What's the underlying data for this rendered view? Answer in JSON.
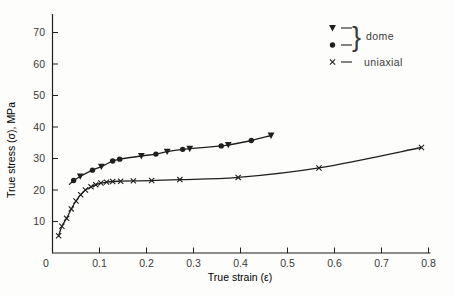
{
  "figure": {
    "background": "#fdfdfb",
    "ink": "#1f1f1f",
    "text_color": "#3a3a3a"
  },
  "chart_data": {
    "type": "line-scatter",
    "title": "",
    "xlabel": "True strain (ε)",
    "ylabel": "True stress (σ), MPa",
    "xlim": [
      0,
      0.82
    ],
    "ylim": [
      0,
      76
    ],
    "grid": false,
    "origin_label": "0",
    "x_tick_values": [
      0.1,
      0.2,
      0.3,
      0.4,
      0.5,
      0.6,
      0.7,
      0.8
    ],
    "x_tick_labels": [
      "0.1",
      "0.2",
      "0.3",
      "0.4",
      "0.5",
      "0.6",
      "0.7",
      "0.8"
    ],
    "y_tick_values": [
      10,
      20,
      30,
      40,
      50,
      60,
      70
    ],
    "y_tick_labels": [
      "10",
      "20",
      "30",
      "40",
      "50",
      "60",
      "70"
    ],
    "legend": {
      "position": "upper-right",
      "groups": [
        {
          "label": "dome",
          "markers": [
            "triangle-down",
            "circle"
          ],
          "braced": true
        },
        {
          "label": "uniaxial",
          "markers": [
            "x"
          ],
          "braced": false
        }
      ]
    },
    "series": [
      {
        "name": "dome-triangle",
        "legend_group": "dome",
        "marker": "triangle-down",
        "points": [
          [
            0.059,
            24.3
          ],
          [
            0.104,
            27.4
          ],
          [
            0.189,
            30.8
          ],
          [
            0.244,
            32.2
          ],
          [
            0.292,
            33.1
          ],
          [
            0.374,
            34.3
          ],
          [
            0.465,
            37.3
          ]
        ]
      },
      {
        "name": "dome-circle",
        "legend_group": "dome",
        "marker": "circle",
        "points": [
          [
            0.045,
            23.0
          ],
          [
            0.085,
            26.3
          ],
          [
            0.128,
            29.2
          ],
          [
            0.143,
            29.8
          ],
          [
            0.22,
            31.4
          ],
          [
            0.277,
            32.9
          ],
          [
            0.359,
            34.0
          ],
          [
            0.423,
            35.7
          ]
        ]
      },
      {
        "name": "uniaxial",
        "legend_group": "uniaxial",
        "marker": "x",
        "points": [
          [
            0.013,
            5.5
          ],
          [
            0.02,
            8.5
          ],
          [
            0.03,
            11.0
          ],
          [
            0.04,
            14.0
          ],
          [
            0.05,
            16.5
          ],
          [
            0.06,
            18.5
          ],
          [
            0.07,
            20.0
          ],
          [
            0.082,
            21.0
          ],
          [
            0.092,
            21.7
          ],
          [
            0.103,
            22.2
          ],
          [
            0.115,
            22.5
          ],
          [
            0.128,
            22.7
          ],
          [
            0.145,
            22.8
          ],
          [
            0.172,
            22.9
          ],
          [
            0.211,
            23.0
          ],
          [
            0.271,
            23.3
          ],
          [
            0.395,
            24.0
          ],
          [
            0.567,
            27.0
          ],
          [
            0.785,
            33.5
          ]
        ]
      }
    ],
    "curves": [
      {
        "name": "dome",
        "through_series": [
          "dome-triangle",
          "dome-circle"
        ],
        "lead_in": [
          [
            0.036,
            21.8
          ]
        ]
      },
      {
        "name": "uniaxial",
        "through_series": [
          "uniaxial"
        ],
        "lead_in": []
      }
    ]
  }
}
